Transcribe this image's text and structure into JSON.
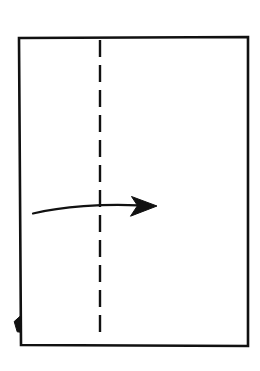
{
  "diagram": {
    "instruction": "Fold the left edge over to the right along the vertical center crease",
    "step_type": "valley-fold",
    "background_color": "#ffffff",
    "ink_color": "#111111",
    "canvas": {
      "width": 260,
      "height": 371
    },
    "paper": {
      "name": "paper-sheet",
      "shape": "rectangle",
      "stroke_color": "#111111",
      "stroke_width": 2.6,
      "fill_color": "#ffffff",
      "corners": {
        "top_left": [
          19,
          38
        ],
        "top_right": [
          248,
          37
        ],
        "bottom_right": [
          248,
          346
        ],
        "bottom_left": [
          21,
          345
        ]
      },
      "path": "M 19 38 L 248 37 L 248 346 L 21 345 Z"
    },
    "fold_line": {
      "name": "vertical-center-crease",
      "line_style": "dashed",
      "meaning": "valley fold crease",
      "stroke_color": "#111111",
      "stroke_width": 2.4,
      "dash_pattern": "17 8",
      "x": 100,
      "y_start": 40,
      "y_end": 337
    },
    "arrow": {
      "name": "fold-direction-arrow",
      "direction": "right",
      "style": "curved",
      "stroke_color": "#111111",
      "stroke_width": 2.2,
      "tail": [
        33,
        213.5
      ],
      "tip": [
        157,
        206
      ],
      "shaft_path": "M 33 213.5 C 62 206.6, 104 203.6, 138.5 205.4",
      "head_path": "M 157 206 L 131.5 196.5 L 137.5 205.6 L 130.5 216.2 Z"
    },
    "corner_flap": {
      "name": "lower-left-edge-flap",
      "description": "small triangular paper flap on the lower left edge",
      "stroke_color": "#111111",
      "fill_color": "#111111",
      "path": "M 20.4 316 L 14.2 321.5 L 17.2 331.8 L 20.6 332.2 Z"
    }
  }
}
